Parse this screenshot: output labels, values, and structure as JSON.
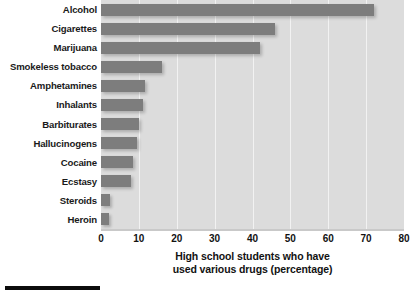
{
  "chart_data": {
    "type": "bar",
    "orientation": "horizontal",
    "title": "",
    "xlabel": "High school students who have used various drugs (percentage)",
    "xlabel_line1": "High school students who have",
    "xlabel_line2": "used various drugs (percentage)",
    "ylabel": "",
    "categories": [
      "Alcohol",
      "Cigarettes",
      "Marijuana",
      "Smokeless tobacco",
      "Amphetamines",
      "Inhalants",
      "Barbiturates",
      "Hallucinogens",
      "Cocaine",
      "Ecstasy",
      "Steroids",
      "Heroin"
    ],
    "values": [
      72,
      46,
      42,
      16,
      11.5,
      11,
      10,
      9.5,
      8.5,
      8,
      2.5,
      2
    ],
    "xlim": [
      0,
      80
    ],
    "xticks": [
      0,
      10,
      20,
      30,
      40,
      50,
      60,
      70,
      80
    ],
    "xtick_labels": [
      "0",
      "10",
      "20",
      "30",
      "40",
      "50",
      "60",
      "70",
      "80"
    ],
    "grid": true,
    "grid_axis": "x",
    "legend": false,
    "colors": {
      "bar": "#7d7d7d",
      "plot_background": "#dcdcdc",
      "gridline": "#f2f2f2",
      "text": "#121212",
      "page_background": "#ffffff",
      "rule": "#0c0c0c"
    }
  }
}
